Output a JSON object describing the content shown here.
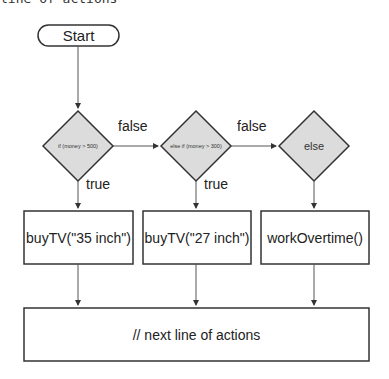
{
  "caption": "line of actions",
  "flowchart": {
    "start": {
      "label": "Start"
    },
    "decisions": [
      {
        "label": "if (money > 500)"
      },
      {
        "label": "else if (money > 300)"
      },
      {
        "label": "else"
      }
    ],
    "edges": {
      "false_1": "false",
      "false_2": "false",
      "true_1": "true",
      "true_2": "true"
    },
    "actions": [
      {
        "label": "buyTV(\"35 inch\")"
      },
      {
        "label": "buyTV(\"27 inch\")"
      },
      {
        "label": "workOvertime()"
      }
    ],
    "end": {
      "label": "// next line of actions"
    }
  },
  "colors": {
    "stroke": "#333333",
    "diamond_fill": "#dcdcdc",
    "background": "#ffffff"
  }
}
